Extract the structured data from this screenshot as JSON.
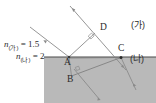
{
  "figure": {
    "width": 156,
    "height": 103,
    "colors": {
      "background": "#ffffff",
      "lower_medium_fill": "#b9b9b9",
      "line": "#555555",
      "text": "#2b2b2b"
    }
  },
  "labels": {
    "point_a": "A",
    "point_b": "B",
    "point_c": "C",
    "point_d": "D",
    "medium_upper": "(가)",
    "medium_lower": "(나)"
  },
  "indices": {
    "upper": {
      "symbol": "n",
      "subscript": "(가)",
      "equals": "=",
      "value": "1.5",
      "full": "n(가) = 1.5"
    },
    "lower": {
      "symbol": "n",
      "subscript": "(나)",
      "equals": "=",
      "value": "2",
      "full": "n(나) = 2"
    }
  },
  "geometry": {
    "interface_y": 57,
    "points": {
      "A": [
        69,
        57
      ],
      "B": [
        71,
        75
      ],
      "C": [
        121,
        57
      ],
      "D": [
        95,
        33
      ]
    },
    "rays": [
      {
        "name": "incident-ray-to-A",
        "from": [
          30,
          27
        ],
        "to": [
          69,
          57
        ],
        "arrow": "mid"
      },
      {
        "name": "wavefront-ray-through-D",
        "from": [
          70,
          6
        ],
        "to": [
          126,
          70
        ],
        "arrow": "both-ends"
      },
      {
        "name": "segment-A-to-D",
        "from": [
          69,
          57
        ],
        "to": [
          95,
          33
        ],
        "arrow": "none"
      },
      {
        "name": "segment-A-to-C",
        "from": [
          69,
          57
        ],
        "to": [
          121,
          57
        ],
        "arrow": "none"
      },
      {
        "name": "refracted-ray-A-to-B",
        "from": [
          69,
          57
        ],
        "to": [
          71,
          75
        ],
        "arrow": "none"
      },
      {
        "name": "ray-B-to-C",
        "from": [
          71,
          75
        ],
        "to": [
          121,
          57
        ],
        "arrow": "none"
      },
      {
        "name": "transmitted-ray-B-down",
        "from": [
          71,
          75
        ],
        "to": [
          98,
          99
        ],
        "arrow": "end"
      },
      {
        "name": "transmitted-ray-C-down",
        "from": [
          121,
          57
        ],
        "to": [
          135,
          88
        ],
        "arrow": "end"
      }
    ],
    "right_angle_marks": [
      {
        "name": "right-angle-at-D",
        "at": [
          90,
          37
        ]
      },
      {
        "name": "right-angle-at-B-junction",
        "at": [
          78,
          70
        ]
      }
    ]
  }
}
